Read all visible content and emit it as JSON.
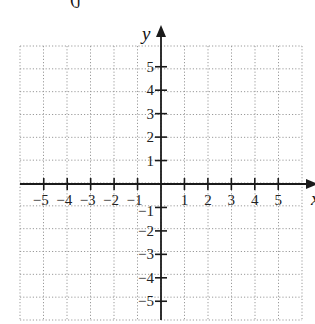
{
  "figure": {
    "part_label": "(j",
    "axes": {
      "x_label": "x",
      "y_label": "y",
      "x_ticks": [
        "−5",
        "−4",
        "−3",
        "−2",
        "−1",
        "1",
        "2",
        "3",
        "4",
        "5"
      ],
      "y_ticks": [
        "5",
        "4",
        "3",
        "2",
        "1",
        "−1",
        "−2",
        "−3",
        "−4",
        "−5"
      ],
      "x_range": [
        -6,
        6
      ],
      "y_range": [
        -6,
        6
      ]
    },
    "grid": {
      "style": "dotted",
      "color": "#9a9a9a",
      "cells_x": 12,
      "cells_y": 12
    },
    "axis_color": "#1a1a1a"
  }
}
